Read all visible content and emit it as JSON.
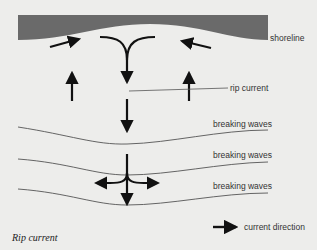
{
  "diagram": {
    "title": "Rip current",
    "labels": {
      "shoreline": "shoreline",
      "rip_current": "rip current",
      "breaking_waves_1": "breaking waves",
      "breaking_waves_2": "breaking waves",
      "breaking_waves_3": "breaking waves"
    },
    "legend": {
      "current_direction": "current direction"
    },
    "colors": {
      "background": "#ededeb",
      "shore": "#6a6a6a",
      "arrows": "#111111",
      "lines": "#555555"
    }
  }
}
